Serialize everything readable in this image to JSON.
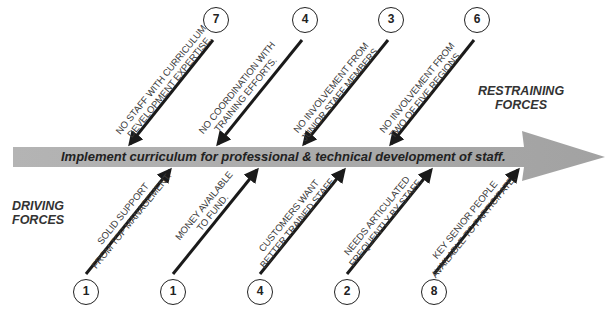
{
  "diagram": {
    "type": "force-field-analysis",
    "goal": "Implement curriculum for professional & technical development of staff.",
    "restraining_label": [
      "RESTRAINING",
      "FORCES"
    ],
    "driving_label": [
      "DRIVING",
      "FORCES"
    ],
    "colors": {
      "arrow_fill": "#a9a9a9",
      "force_arrow": "#1a1a1a",
      "text": "#333333"
    },
    "restraining_forces": [
      {
        "score": "7",
        "lines": [
          "NO STAFF WITH CURRICULUM",
          "DEVELOPMENT EXPERTISE."
        ]
      },
      {
        "score": "4",
        "lines": [
          "NO COORDINATION WITH",
          "TRAINING EFFORTS."
        ]
      },
      {
        "score": "3",
        "lines": [
          "NO INVOLVEMENT FROM",
          "JUNIOR STAFF MEMBERS"
        ]
      },
      {
        "score": "6",
        "lines": [
          "NO INVOLVEMENT FROM",
          "TWO OF FIVE REGIONS."
        ]
      }
    ],
    "driving_forces": [
      {
        "score": "1",
        "lines": [
          "SOLID SUPPORT",
          "FROM TOP MANAGEMENT."
        ]
      },
      {
        "score": "1",
        "lines": [
          "MONEY AVAILABLE",
          "TO FUND."
        ]
      },
      {
        "score": "4",
        "lines": [
          "CUSTOMERS WANT",
          "BETTER TRAINED STAFF."
        ]
      },
      {
        "score": "2",
        "lines": [
          "NEEDS ARTICULATED",
          "FREQUENTLY BY STAFF."
        ]
      },
      {
        "score": "8",
        "lines": [
          "KEY SENIOR PEOPLE",
          "AVAILABLE TO PARTICIPATE."
        ]
      }
    ]
  }
}
